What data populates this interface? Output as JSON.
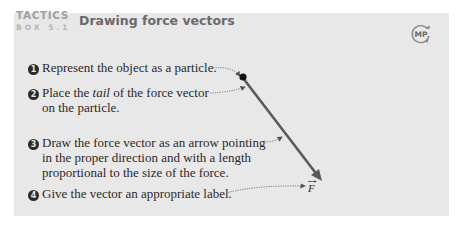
{
  "header": {
    "label": "TACTICS",
    "box_number": "BOX 5.1",
    "title": "Drawing force vectors",
    "badge_icon": "mp-icon",
    "badge_text": "MP"
  },
  "steps": [
    {
      "number": "1",
      "text_before": "Represent the object as a particle.",
      "italic": "",
      "text_after": "",
      "lines": []
    },
    {
      "number": "2",
      "text_before": "Place the ",
      "italic": "tail",
      "text_after": " of the force vector",
      "lines": [
        "on the particle."
      ]
    },
    {
      "number": "3",
      "text_before": "Draw the force vector as an arrow pointing",
      "italic": "",
      "text_after": "",
      "lines": [
        "in the proper direction and with a length",
        "proportional to the size of the force."
      ]
    },
    {
      "number": "4",
      "text_before": "Give the vector an appropriate label.",
      "italic": "",
      "text_after": "",
      "lines": []
    }
  ],
  "diagram": {
    "vector_label": "F",
    "vector_color": "#5a5a5a",
    "particle_color": "#111111"
  }
}
